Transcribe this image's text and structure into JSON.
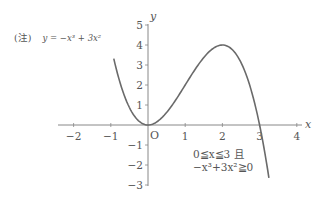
{
  "chart_data": {
    "type": "line",
    "title": "",
    "note_prefix": "(注)",
    "equation_label": "y = −x³ + 3x²",
    "function": "-x^3 + 3x^2",
    "xlabel": "x",
    "ylabel": "y",
    "origin_label": "O",
    "xlim": [
      -2.4,
      4.3
    ],
    "ylim": [
      -3,
      5
    ],
    "x_ticks": [
      -2,
      -1,
      1,
      2,
      3,
      4
    ],
    "y_ticks": [
      5,
      4,
      3,
      2,
      1,
      -1,
      -2,
      -3
    ],
    "x_tick_labels": [
      "−2",
      "−1",
      "1",
      "2",
      "3",
      "4"
    ],
    "y_tick_labels": [
      "5",
      "4",
      "3",
      "2",
      "1",
      "−1",
      "−2",
      "−3"
    ],
    "curve_domain": [
      -0.92,
      3.25
    ],
    "key_points": [
      {
        "x": 0,
        "y": 0,
        "label": "local minimum / origin"
      },
      {
        "x": 2,
        "y": 4,
        "label": "local maximum"
      },
      {
        "x": 3,
        "y": 0,
        "label": "root"
      }
    ],
    "series": [
      {
        "name": "y = −x³ + 3x²",
        "x": [
          -0.92,
          -0.5,
          0,
          0.5,
          1,
          1.5,
          2,
          2.5,
          3,
          3.25
        ],
        "values": [
          3.32,
          0.875,
          0,
          0.625,
          2,
          3.375,
          4,
          3.125,
          0,
          -2.64
        ]
      }
    ],
    "annotation_lines": [
      "0≦x≦3 且",
      "−x³+3x²≧0"
    ],
    "grid": false,
    "legend": "none",
    "line_color": "#666666",
    "axis_color": "#777777"
  }
}
